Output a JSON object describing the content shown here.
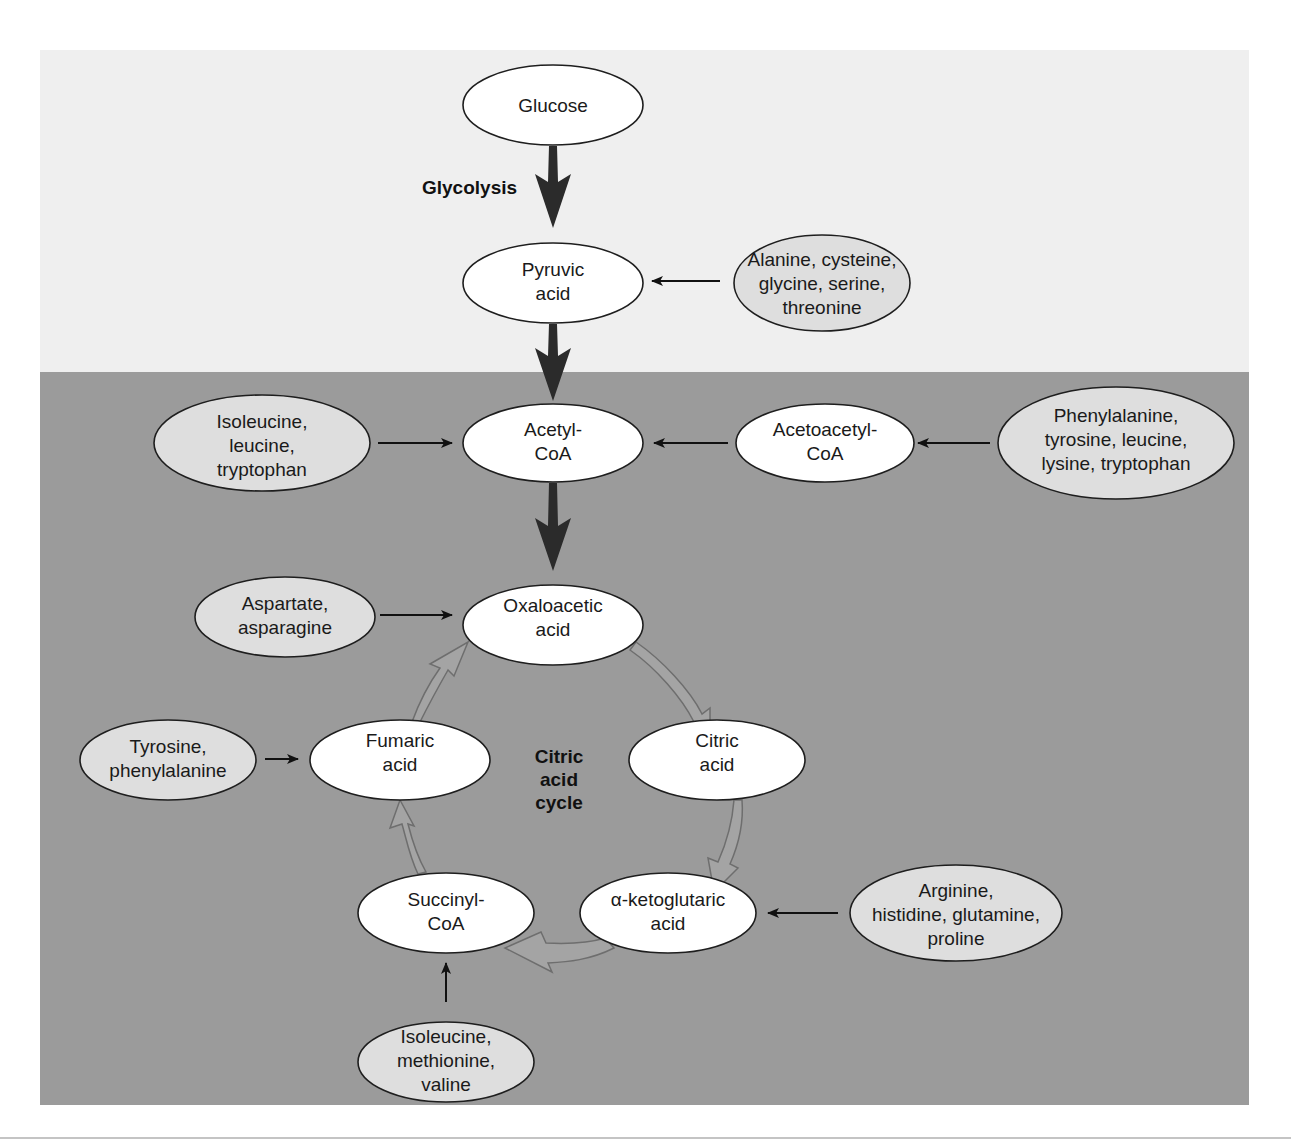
{
  "colors": {
    "page_background": "#ffffff",
    "upper_region": "#efefef",
    "lower_region": "#9b9b9b",
    "metabolite_fill": "#ffffff",
    "amino_acid_fill": "#dedede",
    "outline": "#1e1e1e",
    "main_arrow": "#2b2b2b",
    "cycle_arrow_fill": "#a4a4a4"
  },
  "labels": {
    "glycolysis": "Glycolysis",
    "cycle": [
      "Citric",
      "acid",
      "cycle"
    ]
  },
  "metabolites": {
    "glucose": [
      "Glucose"
    ],
    "pyruvic_acid": [
      "Pyruvic",
      "acid"
    ],
    "acetyl_coa": [
      "Acetyl-",
      "CoA"
    ],
    "acetoacetyl_coa": [
      "Acetoacetyl-",
      "CoA"
    ],
    "oxaloacetic_acid": [
      "Oxaloacetic",
      "acid"
    ],
    "citric_acid": [
      "Citric",
      "acid"
    ],
    "alpha_ketoglutaric_acid": [
      "α-ketoglutaric",
      "acid"
    ],
    "succinyl_coa": [
      "Succinyl-",
      "CoA"
    ],
    "fumaric_acid": [
      "Fumaric",
      "acid"
    ]
  },
  "amino_acid_groups": {
    "to_pyruvic": [
      "Alanine, cysteine,",
      "glycine, serine,",
      "threonine"
    ],
    "to_acetyl_coa": [
      "Isoleucine,",
      "leucine,",
      "tryptophan"
    ],
    "to_acetoacetyl_coa": [
      "Phenylalanine,",
      "tyrosine, leucine,",
      "lysine, tryptophan"
    ],
    "to_oxaloacetic": [
      "Aspartate,",
      "asparagine"
    ],
    "to_fumaric": [
      "Tyrosine,",
      "phenylalanine"
    ],
    "to_alpha_ketoglutaric": [
      "Arginine,",
      "histidine, glutamine,",
      "proline"
    ],
    "to_succinyl_coa": [
      "Isoleucine,",
      "methionine,",
      "valine"
    ]
  }
}
